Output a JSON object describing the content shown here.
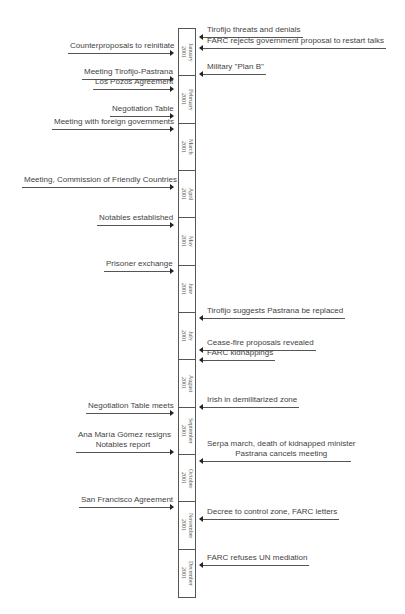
{
  "diagram": {
    "type": "timeline",
    "months": [
      {
        "name": "January",
        "year": "2001"
      },
      {
        "name": "February",
        "year": "2001"
      },
      {
        "name": "March",
        "year": "2001"
      },
      {
        "name": "April",
        "year": "2001"
      },
      {
        "name": "May",
        "year": "2001"
      },
      {
        "name": "June",
        "year": "2001"
      },
      {
        "name": "July",
        "year": "2001"
      },
      {
        "name": "August",
        "year": "2001"
      },
      {
        "name": "September",
        "year": "2001"
      },
      {
        "name": "October",
        "year": "2001"
      },
      {
        "name": "November",
        "year": "2001"
      },
      {
        "name": "December",
        "year": "2001"
      }
    ],
    "left_events": [
      {
        "label": "Counterproposals to reinitiate",
        "y": 52,
        "x": 68
      },
      {
        "label": "Meeting Tirofijo-Pastrana",
        "y": 78,
        "x": 82
      },
      {
        "label": "Los Pozos Agreement",
        "y": 88,
        "x": 93
      },
      {
        "label": "Negotiation Table",
        "y": 115,
        "x": 110
      },
      {
        "label": "Meeting with foreign governments",
        "y": 128,
        "x": 52
      },
      {
        "label": "Meeting, Commission of Friendly Countries",
        "y": 186,
        "x": 22
      },
      {
        "label": "Notables established",
        "y": 224,
        "x": 97
      },
      {
        "label": "Prisoner exchange",
        "y": 270,
        "x": 104
      },
      {
        "label": "Negotiation Table meets",
        "y": 412,
        "x": 86
      },
      {
        "label": "Ana María Gómez resigns",
        "line2": "Notables report",
        "y": 451,
        "x": 76
      },
      {
        "label": "San Francisco Agreement",
        "y": 506,
        "x": 79
      }
    ],
    "right_events": [
      {
        "label": "Tirofijo threats and denials",
        "y": 36
      },
      {
        "label": "FARC rejects government proposal to restart talks",
        "y": 47
      },
      {
        "label": "Military \"Plan B\"",
        "y": 73
      },
      {
        "label": "Tirofijo suggests Pastrana be replaced",
        "y": 317
      },
      {
        "label": "Cease-fire proposals revealed",
        "y": 349
      },
      {
        "label": "FARC kidnappings",
        "y": 359
      },
      {
        "label": "Irish in demilitarized zone",
        "y": 406
      },
      {
        "label": "Serpa march, death of kidnapped minister",
        "line2": "Pastrana cancels meeting",
        "y": 460
      },
      {
        "label": "Decree to control zone, FARC letters",
        "y": 518
      },
      {
        "label": "FARC refuses UN mediation",
        "y": 564
      }
    ]
  }
}
